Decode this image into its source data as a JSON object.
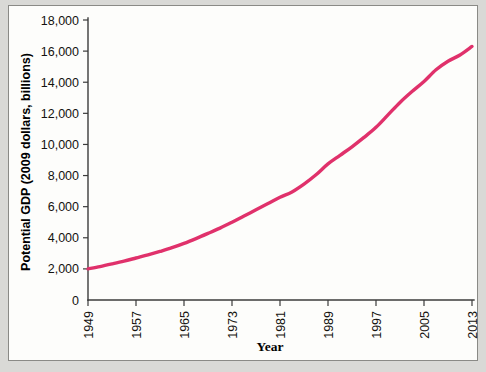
{
  "figure": {
    "background_color": "#d9d9d6",
    "panel_color": "#fdfdfb",
    "frame_color": "#8a8a86"
  },
  "chart_data": {
    "type": "line",
    "title": "",
    "xlabel": "Year",
    "ylabel": "Potential GDP (2009 dollars, billions)",
    "xlim": [
      1949,
      2013
    ],
    "ylim": [
      0,
      18000
    ],
    "grid": false,
    "legend": false,
    "line_color": "#e0316b",
    "xticklabels": [
      "1949",
      "1957",
      "1965",
      "1973",
      "1981",
      "1989",
      "1997",
      "2005",
      "2013"
    ],
    "xtickvalues": [
      1949,
      1957,
      1965,
      1973,
      1981,
      1989,
      1997,
      2005,
      2013
    ],
    "yticklabels": [
      "0",
      "2,000",
      "4,000",
      "6,000",
      "8,000",
      "10,000",
      "12,000",
      "14,000",
      "16,000",
      "18,000"
    ],
    "ytickvalues": [
      0,
      2000,
      4000,
      6000,
      8000,
      10000,
      12000,
      14000,
      16000,
      18000
    ],
    "series": [
      {
        "name": "Potential GDP",
        "x": [
          1949,
          1951,
          1953,
          1955,
          1957,
          1959,
          1961,
          1963,
          1965,
          1967,
          1969,
          1971,
          1973,
          1975,
          1977,
          1979,
          1981,
          1983,
          1985,
          1987,
          1989,
          1991,
          1993,
          1995,
          1997,
          1999,
          2001,
          2003,
          2005,
          2007,
          2009,
          2011,
          2013
        ],
        "values": [
          2000,
          2150,
          2320,
          2500,
          2700,
          2900,
          3120,
          3360,
          3640,
          3950,
          4280,
          4620,
          5000,
          5400,
          5800,
          6200,
          6600,
          6950,
          7450,
          8050,
          8750,
          9300,
          9850,
          10450,
          11100,
          11900,
          12700,
          13400,
          14050,
          14800,
          15350,
          15750,
          16300
        ]
      }
    ]
  },
  "axis_titles": {
    "y": "Potential GDP (2009 dollars, billions)",
    "x": "Year"
  }
}
